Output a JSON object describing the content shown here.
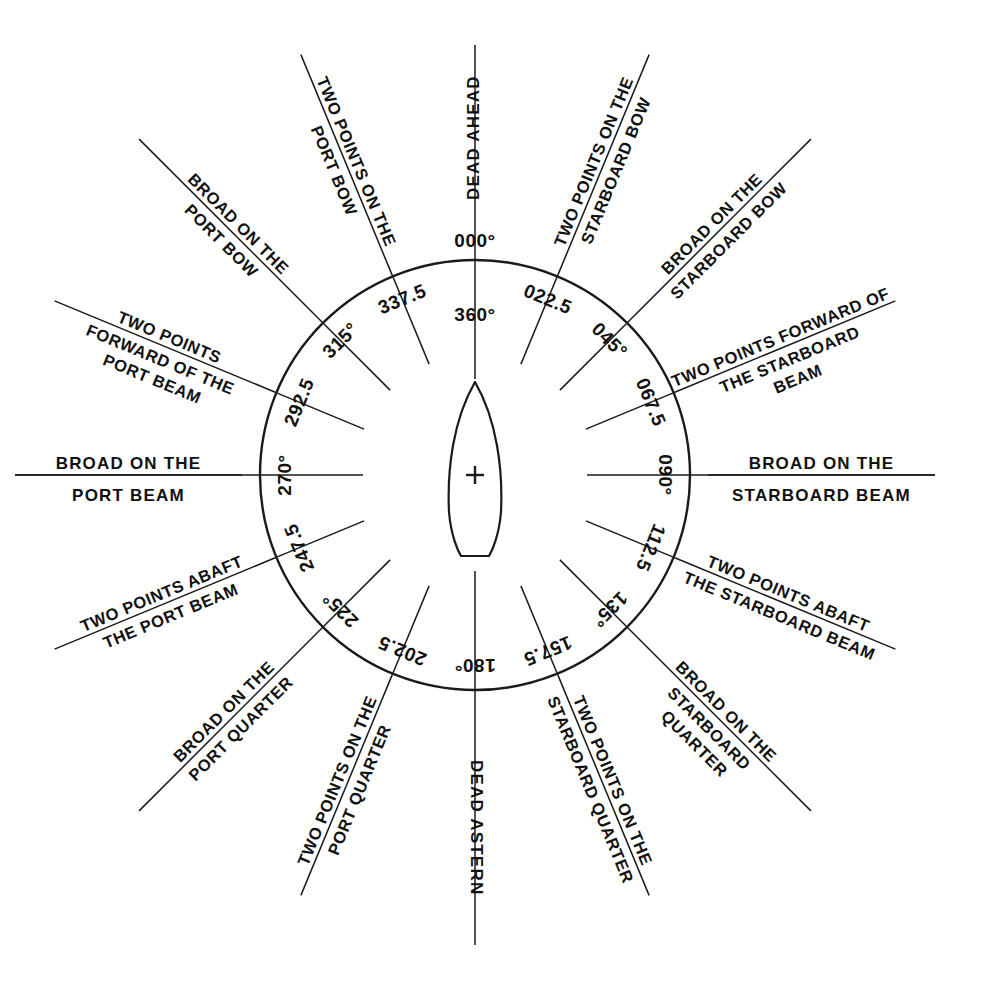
{
  "figure": {
    "center_marker": "+",
    "ship_symbol": "ship-outline",
    "line_color": "#1a1a1a",
    "background_color": "#ffffff"
  },
  "chart_data": {
    "type": "scatter",
    "xlabel": "",
    "ylabel": "",
    "grid": false,
    "legend": "none",
    "center": [
      475,
      475
    ],
    "radius": 215,
    "categories": [
      "000",
      "022.5",
      "045",
      "067.5",
      "090",
      "112.5",
      "135",
      "157.5",
      "180",
      "202.5",
      "225",
      "247.5",
      "270",
      "292.5",
      "315",
      "337.5"
    ],
    "values": [
      0,
      22.5,
      45,
      67.5,
      90,
      112.5,
      135,
      157.5,
      180,
      202.5,
      225,
      247.5,
      270,
      292.5,
      315,
      337.5
    ],
    "bearings": [
      {
        "deg": 0,
        "deg_label": "000°",
        "deg_label_secondary": "360°",
        "name": "DEAD AHEAD",
        "name_lines": [
          "DEAD AHEAD"
        ],
        "style": "vertical-up"
      },
      {
        "deg": 22.5,
        "deg_label": "022.5",
        "name": "TWO POINTS ON THE STARBOARD BOW",
        "name_lines": [
          "TWO POINTS ON THE",
          "STARBOARD BOW"
        ],
        "style": "radial"
      },
      {
        "deg": 45,
        "deg_label": "045°",
        "name": "BROAD ON THE STARBOARD BOW",
        "name_lines": [
          "BROAD ON THE",
          "STARBOARD BOW"
        ],
        "style": "radial"
      },
      {
        "deg": 67.5,
        "deg_label": "067.5",
        "name": "TWO POINTS FORWARD OF THE STARBOARD BEAM",
        "name_lines": [
          "TWO POINTS FORWARD OF",
          "THE STARBOARD",
          "BEAM"
        ],
        "style": "radial"
      },
      {
        "deg": 90,
        "deg_label": "090°",
        "name": "BROAD ON THE STARBOARD BEAM",
        "name_lines": [
          "BROAD ON THE",
          "STARBOARD BEAM"
        ],
        "style": "horizontal-right"
      },
      {
        "deg": 112.5,
        "deg_label": "112.5",
        "name": "TWO POINTS ABAFT THE STARBOARD BEAM",
        "name_lines": [
          "TWO POINTS ABAFT",
          "THE STARBOARD BEAM"
        ],
        "style": "radial"
      },
      {
        "deg": 135,
        "deg_label": "135°",
        "name": "BROAD ON THE STARBOARD QUARTER",
        "name_lines": [
          "BROAD ON THE",
          "STARBOARD",
          "QUARTER"
        ],
        "style": "radial"
      },
      {
        "deg": 157.5,
        "deg_label": "157.5",
        "name": "TWO POINTS ON THE STARBOARD QUARTER",
        "name_lines": [
          "TWO POINTS ON THE",
          "STARBOARD QUARTER"
        ],
        "style": "radial"
      },
      {
        "deg": 180,
        "deg_label": "180°",
        "name": "DEAD ASTERN",
        "name_lines": [
          "DEAD ASTERN"
        ],
        "style": "vertical-down"
      },
      {
        "deg": 202.5,
        "deg_label": "202.5",
        "name": "TWO POINTS ON THE PORT QUARTER",
        "name_lines": [
          "TWO POINTS ON THE",
          "PORT QUARTER"
        ],
        "style": "radial"
      },
      {
        "deg": 225,
        "deg_label": "225°",
        "name": "BROAD ON THE PORT QUARTER",
        "name_lines": [
          "BROAD ON THE",
          "PORT QUARTER"
        ],
        "style": "radial"
      },
      {
        "deg": 247.5,
        "deg_label": "247.5",
        "name": "TWO POINTS ABAFT THE PORT BEAM",
        "name_lines": [
          "TWO POINTS ABAFT",
          "THE PORT BEAM"
        ],
        "style": "radial"
      },
      {
        "deg": 270,
        "deg_label": "270°",
        "name": "BROAD ON THE PORT BEAM",
        "name_lines": [
          "BROAD ON THE",
          "PORT BEAM"
        ],
        "style": "horizontal-left"
      },
      {
        "deg": 292.5,
        "deg_label": "292.5",
        "name": "TWO POINTS FORWARD OF THE PORT BEAM",
        "name_lines": [
          "TWO POINTS",
          "FORWARD OF THE",
          "PORT BEAM"
        ],
        "style": "radial"
      },
      {
        "deg": 315,
        "deg_label": "315°",
        "name": "BROAD ON THE PORT BOW",
        "name_lines": [
          "BROAD ON THE",
          "PORT BOW"
        ],
        "style": "radial"
      },
      {
        "deg": 337.5,
        "deg_label": "337.5",
        "name": "TWO POINTS ON THE PORT BOW",
        "name_lines": [
          "TWO POINTS ON THE",
          "PORT BOW"
        ],
        "style": "radial"
      }
    ]
  }
}
